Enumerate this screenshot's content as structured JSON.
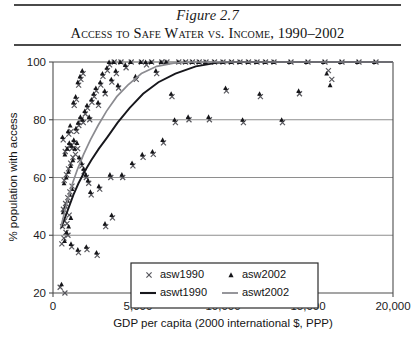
{
  "figure": {
    "number": "Figure 2.7",
    "title": "Access to Safe Water vs. Income, 1990–2002"
  },
  "chart_data": {
    "type": "scatter",
    "title": "Access to Safe Water vs. Income, 1990–2002",
    "xlabel": "GDP per capita (2000 international $, PPP)",
    "ylabel": "% population with access",
    "xlim": [
      0,
      20000
    ],
    "ylim": [
      20,
      100
    ],
    "xticks": [
      0,
      5000,
      10000,
      15000,
      20000
    ],
    "xtick_labels": [
      "0",
      "5,000",
      "10,000",
      "15,000",
      "20,000"
    ],
    "yticks": [
      20,
      40,
      60,
      80,
      100
    ],
    "ytick_labels": [
      "20",
      "40",
      "60",
      "80",
      "100"
    ],
    "grid": "horizontal",
    "legend_position": "lower-center",
    "legend": [
      {
        "label": "asw1990",
        "marker": "x",
        "color": "#56565c"
      },
      {
        "label": "asw2002",
        "marker": "triangle",
        "color": "#16161a"
      },
      {
        "label": "aswt1990",
        "marker": "line",
        "color": "#17171c"
      },
      {
        "label": "aswt2002",
        "marker": "line",
        "color": "#8b8b90"
      }
    ],
    "series": [
      {
        "name": "asw1990",
        "marker": "x",
        "color": "#56565c",
        "points": [
          [
            420,
            22
          ],
          [
            700,
            20
          ],
          [
            520,
            37
          ],
          [
            640,
            39
          ],
          [
            760,
            41
          ],
          [
            880,
            40
          ],
          [
            560,
            43
          ],
          [
            690,
            45
          ],
          [
            820,
            44
          ],
          [
            950,
            47
          ],
          [
            610,
            49
          ],
          [
            740,
            51
          ],
          [
            870,
            53
          ],
          [
            990,
            55
          ],
          [
            1120,
            57
          ],
          [
            660,
            59
          ],
          [
            790,
            61
          ],
          [
            910,
            63
          ],
          [
            1040,
            65
          ],
          [
            1170,
            67
          ],
          [
            720,
            69
          ],
          [
            850,
            70
          ],
          [
            980,
            71
          ],
          [
            1110,
            70
          ],
          [
            1240,
            72
          ],
          [
            600,
            73
          ],
          [
            930,
            75
          ],
          [
            1060,
            76
          ],
          [
            1320,
            68
          ],
          [
            1450,
            70
          ],
          [
            1580,
            66
          ],
          [
            1700,
            64
          ],
          [
            1830,
            62
          ],
          [
            1960,
            60
          ],
          [
            2100,
            58
          ],
          [
            1390,
            76
          ],
          [
            1520,
            78
          ],
          [
            1650,
            80
          ],
          [
            1780,
            79
          ],
          [
            1900,
            82
          ],
          [
            2030,
            84
          ],
          [
            2160,
            80
          ],
          [
            2290,
            86
          ],
          [
            2420,
            88
          ],
          [
            2550,
            90
          ],
          [
            1250,
            85
          ],
          [
            1380,
            87
          ],
          [
            1510,
            92
          ],
          [
            1640,
            94
          ],
          [
            1770,
            96
          ],
          [
            2680,
            85
          ],
          [
            2810,
            92
          ],
          [
            2940,
            95
          ],
          [
            3070,
            89
          ],
          [
            3200,
            97
          ],
          [
            3330,
            99
          ],
          [
            3460,
            93
          ],
          [
            3600,
            100
          ],
          [
            3730,
            96
          ],
          [
            3860,
            91
          ],
          [
            4000,
            100
          ],
          [
            4300,
            98
          ],
          [
            4600,
            100
          ],
          [
            4900,
            94
          ],
          [
            5200,
            100
          ],
          [
            5500,
            99
          ],
          [
            5800,
            100
          ],
          [
            6100,
            96
          ],
          [
            6400,
            100
          ],
          [
            6700,
            100
          ],
          [
            7000,
            88
          ],
          [
            7400,
            100
          ],
          [
            7800,
            100
          ],
          [
            8200,
            100
          ],
          [
            8600,
            100
          ],
          [
            9000,
            100
          ],
          [
            9500,
            100
          ],
          [
            10000,
            100
          ],
          [
            10500,
            100
          ],
          [
            11000,
            100
          ],
          [
            11500,
            100
          ],
          [
            12000,
            100
          ],
          [
            12500,
            100
          ],
          [
            13000,
            100
          ],
          [
            14000,
            100
          ],
          [
            15000,
            100
          ],
          [
            16000,
            100
          ],
          [
            16200,
            97
          ],
          [
            16400,
            94
          ],
          [
            17000,
            100
          ],
          [
            18000,
            100
          ],
          [
            19000,
            100
          ],
          [
            1100,
            36
          ],
          [
            1500,
            34
          ],
          [
            2000,
            35
          ],
          [
            2600,
            33
          ],
          [
            3100,
            43
          ],
          [
            3500,
            46
          ],
          [
            2250,
            54
          ],
          [
            2750,
            56
          ],
          [
            3400,
            60
          ],
          [
            4100,
            60
          ],
          [
            4700,
            64
          ],
          [
            5300,
            67
          ],
          [
            5900,
            68
          ],
          [
            6500,
            72
          ],
          [
            7200,
            79
          ],
          [
            8000,
            80
          ],
          [
            9200,
            80
          ],
          [
            10200,
            90
          ],
          [
            11200,
            79
          ],
          [
            12200,
            88
          ],
          [
            13500,
            79
          ],
          [
            14500,
            89
          ]
        ]
      },
      {
        "name": "asw2002",
        "marker": "triangle",
        "color": "#16161a",
        "points": [
          [
            500,
            23
          ],
          [
            680,
            38
          ],
          [
            800,
            41
          ],
          [
            920,
            43
          ],
          [
            1050,
            46
          ],
          [
            600,
            48
          ],
          [
            730,
            50
          ],
          [
            860,
            52
          ],
          [
            990,
            54
          ],
          [
            1120,
            56
          ],
          [
            650,
            58
          ],
          [
            780,
            60
          ],
          [
            910,
            62
          ],
          [
            1040,
            64
          ],
          [
            1170,
            66
          ],
          [
            700,
            68
          ],
          [
            830,
            70
          ],
          [
            960,
            72
          ],
          [
            1090,
            71
          ],
          [
            1220,
            73
          ],
          [
            560,
            74
          ],
          [
            890,
            76
          ],
          [
            1010,
            78
          ],
          [
            1280,
            70
          ],
          [
            1410,
            72
          ],
          [
            1540,
            67
          ],
          [
            1670,
            65
          ],
          [
            1800,
            63
          ],
          [
            1930,
            61
          ],
          [
            2060,
            59
          ],
          [
            1350,
            77
          ],
          [
            1480,
            79
          ],
          [
            1610,
            81
          ],
          [
            1740,
            80
          ],
          [
            1870,
            83
          ],
          [
            2000,
            85
          ],
          [
            2130,
            81
          ],
          [
            2260,
            87
          ],
          [
            2390,
            89
          ],
          [
            2520,
            91
          ],
          [
            1200,
            86
          ],
          [
            1330,
            88
          ],
          [
            1460,
            93
          ],
          [
            1590,
            95
          ],
          [
            1720,
            97
          ],
          [
            2650,
            86
          ],
          [
            2780,
            93
          ],
          [
            2910,
            96
          ],
          [
            3040,
            90
          ],
          [
            3170,
            98
          ],
          [
            3300,
            100
          ],
          [
            3430,
            94
          ],
          [
            3560,
            100
          ],
          [
            3690,
            97
          ],
          [
            3820,
            92
          ],
          [
            3950,
            100
          ],
          [
            4250,
            99
          ],
          [
            4550,
            100
          ],
          [
            4850,
            95
          ],
          [
            5150,
            100
          ],
          [
            5450,
            100
          ],
          [
            5750,
            100
          ],
          [
            6050,
            97
          ],
          [
            6350,
            100
          ],
          [
            6650,
            100
          ],
          [
            6950,
            89
          ],
          [
            7350,
            100
          ],
          [
            7750,
            100
          ],
          [
            8150,
            100
          ],
          [
            8550,
            100
          ],
          [
            8950,
            100
          ],
          [
            9450,
            100
          ],
          [
            9950,
            100
          ],
          [
            10450,
            100
          ],
          [
            10950,
            100
          ],
          [
            11450,
            100
          ],
          [
            11950,
            100
          ],
          [
            12450,
            100
          ],
          [
            12950,
            100
          ],
          [
            13900,
            100
          ],
          [
            14900,
            100
          ],
          [
            15900,
            100
          ],
          [
            16100,
            96
          ],
          [
            16300,
            92
          ],
          [
            16900,
            100
          ],
          [
            17900,
            100
          ],
          [
            18900,
            100
          ],
          [
            1060,
            37
          ],
          [
            1460,
            35
          ],
          [
            1960,
            36
          ],
          [
            2560,
            34
          ],
          [
            3060,
            44
          ],
          [
            3450,
            47
          ],
          [
            2200,
            55
          ],
          [
            2700,
            57
          ],
          [
            3350,
            61
          ],
          [
            4050,
            61
          ],
          [
            4650,
            65
          ],
          [
            5250,
            68
          ],
          [
            5850,
            69
          ],
          [
            6450,
            73
          ],
          [
            7150,
            80
          ],
          [
            7950,
            81
          ],
          [
            9150,
            81
          ],
          [
            10150,
            91
          ],
          [
            11150,
            80
          ],
          [
            12150,
            89
          ],
          [
            13450,
            80
          ],
          [
            14450,
            90
          ]
        ]
      }
    ],
    "trend_lines": [
      {
        "name": "aswt1990",
        "color": "#17171c",
        "points": [
          [
            480,
            42.5
          ],
          [
            700,
            46
          ],
          [
            950,
            50
          ],
          [
            1200,
            54
          ],
          [
            1500,
            58
          ],
          [
            1850,
            62
          ],
          [
            2250,
            66
          ],
          [
            2700,
            70
          ],
          [
            3200,
            74
          ],
          [
            3800,
            79
          ],
          [
            4500,
            84
          ],
          [
            5300,
            89
          ],
          [
            6200,
            93
          ],
          [
            7200,
            96
          ],
          [
            8400,
            98.5
          ],
          [
            9600,
            99.7
          ],
          [
            10500,
            100
          ],
          [
            20000,
            100
          ]
        ]
      },
      {
        "name": "aswt2002",
        "color": "#8b8b90",
        "points": [
          [
            470,
            43
          ],
          [
            680,
            48
          ],
          [
            900,
            53
          ],
          [
            1150,
            58
          ],
          [
            1450,
            63
          ],
          [
            1800,
            68
          ],
          [
            2200,
            73
          ],
          [
            2650,
            78
          ],
          [
            3150,
            83
          ],
          [
            3750,
            88
          ],
          [
            4400,
            92
          ],
          [
            5200,
            96
          ],
          [
            6100,
            98.5
          ],
          [
            7100,
            99.6
          ],
          [
            8200,
            100
          ],
          [
            20000,
            100
          ]
        ]
      }
    ]
  }
}
